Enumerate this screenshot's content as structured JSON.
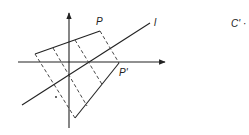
{
  "figure": {
    "labels": {
      "point_p": "P",
      "point_p_prime": "P'",
      "line_l": "l",
      "c_prime": "C' ·"
    },
    "axes": {
      "origin": [
        69,
        62
      ],
      "x_axis": {
        "from": [
          18,
          62
        ],
        "to": [
          165,
          62
        ],
        "arrow": true
      },
      "y_axis": {
        "from": [
          69,
          128
        ],
        "to": [
          69,
          13
        ],
        "arrow": true
      }
    },
    "line_l": {
      "from": [
        22,
        105
      ],
      "to": [
        150,
        23
      ]
    },
    "quadrilateral": {
      "vertices": {
        "left": [
          35,
          54
        ],
        "P": [
          100,
          31
        ],
        "P_prime": [
          119,
          63
        ],
        "bottom": [
          75,
          118
        ]
      },
      "solid_edges": [
        [
          "left",
          "P"
        ],
        [
          "P_prime",
          "bottom"
        ]
      ],
      "dashed_edges": [
        [
          "P",
          "P_prime"
        ],
        [
          "left",
          "bottom"
        ]
      ]
    },
    "internal_dashed_lines": [
      {
        "from": [
          53,
          48
        ],
        "to": [
          87,
          106
        ]
      },
      {
        "from": [
          75,
          40
        ],
        "to": [
          103,
          86
        ]
      }
    ],
    "dot": [
      56,
      97
    ],
    "colors": {
      "ink": "#222222",
      "background": "#ffffff"
    }
  }
}
